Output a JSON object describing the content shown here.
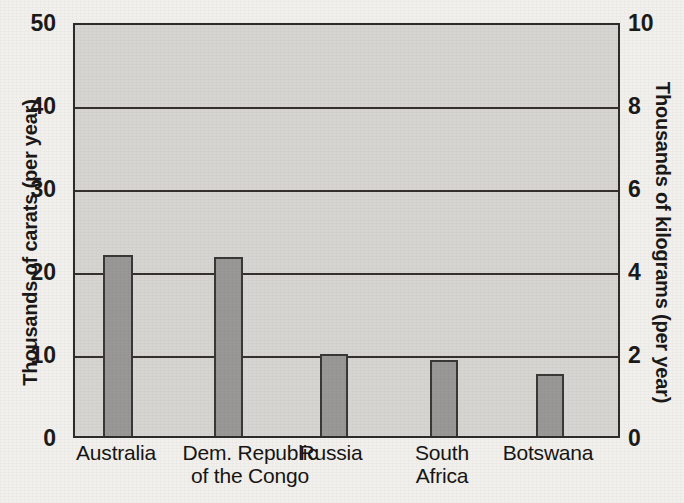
{
  "chart_data": {
    "type": "bar",
    "title": "",
    "categories": [
      "Australia",
      "Dem. Republic of the Congo",
      "Russia",
      "South Africa",
      "Botswana"
    ],
    "category_lines": [
      [
        "Australia"
      ],
      [
        "Dem. Republic",
        "of the Congo"
      ],
      [
        "Russia"
      ],
      [
        "South",
        "Africa"
      ],
      [
        "Botswana"
      ]
    ],
    "values": [
      22.3,
      22.0,
      10.4,
      9.6,
      7.9
    ],
    "xlabel": "",
    "ylabel": "Thousands of carats (per year)",
    "ylabel_right": "Thousands of kilograms (per year)",
    "ylim": [
      0,
      50
    ],
    "ylim_right": [
      0,
      10
    ],
    "yticks": [
      0,
      10,
      20,
      30,
      40,
      50
    ],
    "yticks_right": [
      0,
      2,
      4,
      6,
      8,
      10
    ],
    "ytick_labels": [
      "0",
      "10",
      "20",
      "30",
      "40",
      "50"
    ],
    "ytick_labels_right": [
      "0",
      "2",
      "4",
      "6",
      "8",
      "10"
    ],
    "grid": true,
    "legend": false,
    "bar_color": "#9a9896",
    "bar_edge_color": "#3a3836",
    "plot_background": "#d7d5d2",
    "page_background": "#f2f0ec"
  },
  "ghost_text": [
    "the raw crystals. Nowadays, more than",
    "of the world's diamonds are produced",
    "a handful of countries.",
    "of all natural diamonds",
    "produced every year."
  ]
}
